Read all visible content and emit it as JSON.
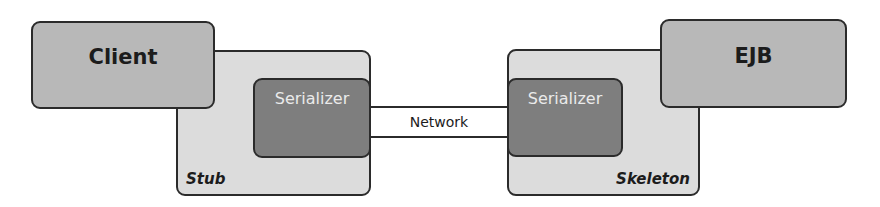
{
  "diagram": {
    "client": {
      "label": "Client"
    },
    "ejb": {
      "label": "EJB"
    },
    "stub": {
      "label": "Stub",
      "serializer_label": "Serializer"
    },
    "skeleton": {
      "label": "Skeleton",
      "serializer_label": "Serializer"
    },
    "network": {
      "label": "Network"
    }
  },
  "colors": {
    "endpoint_fill": "#b8b8b8",
    "container_fill": "#dcdcdc",
    "serializer_fill": "#7e7e7e",
    "border": "#2b2b2b"
  }
}
